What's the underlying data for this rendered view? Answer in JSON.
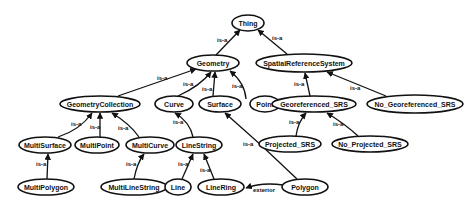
{
  "diagram": {
    "type": "ontology-class-hierarchy",
    "nodes": [
      {
        "id": "Thing",
        "label": "Thing",
        "cx": 248,
        "cy": 23,
        "rx": 16,
        "ry": 8
      },
      {
        "id": "Geometry",
        "label": "Geometry",
        "cx": 213,
        "cy": 63,
        "rx": 26,
        "ry": 8
      },
      {
        "id": "SpatialReferenceSystem",
        "label": "SpatialReferenceSystem",
        "cx": 304,
        "cy": 63,
        "rx": 48,
        "ry": 9
      },
      {
        "id": "GeometryCollection",
        "label": "GeometryCollection",
        "cx": 100,
        "cy": 104,
        "rx": 40,
        "ry": 8
      },
      {
        "id": "Curve",
        "label": "Curve",
        "cx": 174,
        "cy": 104,
        "rx": 19,
        "ry": 8
      },
      {
        "id": "Surface",
        "label": "Surface",
        "cx": 220,
        "cy": 104,
        "rx": 21,
        "ry": 8
      },
      {
        "id": "Point",
        "label": "Point",
        "cx": 265,
        "cy": 104,
        "rx": 15,
        "ry": 8
      },
      {
        "id": "Georeferenced_SRS",
        "label": "Georeferenced_SRS",
        "cx": 314,
        "cy": 104,
        "rx": 42,
        "ry": 8
      },
      {
        "id": "No_Georeferenced_SRS",
        "label": "No_Georeferenced_SRS",
        "cx": 415,
        "cy": 104,
        "rx": 48,
        "ry": 9
      },
      {
        "id": "MultiSurface",
        "label": "MultiSurface",
        "cx": 45,
        "cy": 145,
        "rx": 26,
        "ry": 8
      },
      {
        "id": "MultiPoint",
        "label": "MultiPoint",
        "cx": 97,
        "cy": 145,
        "rx": 22,
        "ry": 8
      },
      {
        "id": "MultiCurve",
        "label": "MultiCurve",
        "cx": 150,
        "cy": 145,
        "rx": 24,
        "ry": 8
      },
      {
        "id": "LineString",
        "label": "LineString",
        "cx": 199,
        "cy": 145,
        "rx": 23,
        "ry": 8
      },
      {
        "id": "Projected_SRS",
        "label": "Projected_SRS",
        "cx": 290,
        "cy": 144,
        "rx": 31,
        "ry": 8
      },
      {
        "id": "No_Projected_SRS",
        "label": "No_Projected_SRS",
        "cx": 370,
        "cy": 144,
        "rx": 38,
        "ry": 8
      },
      {
        "id": "MultiPolygon",
        "label": "MultiPolygon",
        "cx": 46,
        "cy": 187,
        "rx": 28,
        "ry": 8
      },
      {
        "id": "MultiLineString",
        "label": "MultiLineString",
        "cx": 134,
        "cy": 187,
        "rx": 33,
        "ry": 8
      },
      {
        "id": "Line",
        "label": "Line",
        "cx": 178,
        "cy": 187,
        "rx": 13,
        "ry": 8
      },
      {
        "id": "LineRing",
        "label": "LineRing",
        "cx": 221,
        "cy": 187,
        "rx": 23,
        "ry": 8
      },
      {
        "id": "Polygon",
        "label": "Polygon",
        "cx": 305,
        "cy": 187,
        "rx": 23,
        "ry": 8
      }
    ],
    "edges": [
      {
        "from": "Geometry",
        "to": "Thing",
        "label": "is-a",
        "path": "M 216 55 L 240 30",
        "lx": 217,
        "ly": 42
      },
      {
        "from": "SpatialReferenceSystem",
        "to": "Thing",
        "label": "is-a",
        "path": "M 287 54 Q 270 40 258 30",
        "lx": 272,
        "ly": 40
      },
      {
        "from": "GeometryCollection",
        "to": "Geometry",
        "label": "is-a",
        "path": "M 118 96 L 196 69",
        "lx": 157,
        "ly": 80
      },
      {
        "from": "Curve",
        "to": "Geometry",
        "label": "is-a",
        "path": "M 178 96 Q 200 86 211 72",
        "lx": 183,
        "ly": 86
      },
      {
        "from": "Surface",
        "to": "Geometry",
        "label": "is-a",
        "path": "M 213 96 L 215 72",
        "lx": 202,
        "ly": 91
      },
      {
        "from": "Point",
        "to": "Geometry",
        "label": "is-a",
        "path": "M 246 99 Q 245 83 230 71",
        "lx": 232,
        "ly": 88
      },
      {
        "from": "Georeferenced_SRS",
        "to": "SpatialReferenceSystem",
        "label": "is-a",
        "path": "M 310 96 L 305 73",
        "lx": 294,
        "ly": 86
      },
      {
        "from": "No_Georeferenced_SRS",
        "to": "SpatialReferenceSystem",
        "label": "is-a",
        "path": "M 386 96 L 327 72",
        "lx": 350,
        "ly": 90
      },
      {
        "from": "MultiSurface",
        "to": "GeometryCollection",
        "label": "is-a",
        "path": "M 58 137 Q 80 130 92 113",
        "lx": 71,
        "ly": 126
      },
      {
        "from": "MultiPoint",
        "to": "GeometryCollection",
        "label": "is-a",
        "path": "M 100 137 L 100 113",
        "lx": 90,
        "ly": 129
      },
      {
        "from": "MultiCurve",
        "to": "GeometryCollection",
        "label": "is-a",
        "path": "M 139 137 Q 130 124 112 113",
        "lx": 118,
        "ly": 130
      },
      {
        "from": "LineString",
        "to": "Curve",
        "label": "is-a",
        "path": "M 193 137 Q 190 122 175 113",
        "lx": 173,
        "ly": 124
      },
      {
        "from": "MultiPolygon",
        "to": "MultiSurface",
        "label": "is-a",
        "path": "M 47 179 L 48 154",
        "lx": 36,
        "ly": 166
      },
      {
        "from": "MultiLineString",
        "to": "MultiCurve",
        "label": "is-a",
        "path": "M 134 179 Q 137 163 144 154",
        "lx": 126,
        "ly": 166
      },
      {
        "from": "Line",
        "to": "LineString",
        "label": "is-a",
        "path": "M 182 179 L 193 154",
        "lx": 178,
        "ly": 166
      },
      {
        "from": "LineRing",
        "to": "LineString",
        "label": "is-a",
        "path": "M 214 179 L 204 154",
        "lx": 200,
        "ly": 172
      },
      {
        "from": "Polygon",
        "to": "Surface",
        "label": "is-a",
        "path": "M 297 179 Q 262 145 225 113",
        "lx": 243,
        "ly": 146
      },
      {
        "from": "Projected_SRS",
        "to": "Georeferenced_SRS",
        "label": "is-a",
        "path": "M 296 136 Q 298 122 306 113",
        "lx": 289,
        "ly": 124
      },
      {
        "from": "No_Projected_SRS",
        "to": "Georeferenced_SRS",
        "label": "is-a",
        "path": "M 358 136 Q 345 124 327 113",
        "lx": 333,
        "ly": 126
      },
      {
        "from": "Polygon",
        "to": "LineRing",
        "label": "exterior",
        "path": "M 283 185 Q 262 182 246 188",
        "lx": 253,
        "ly": 192
      }
    ]
  }
}
